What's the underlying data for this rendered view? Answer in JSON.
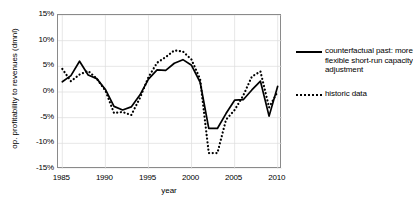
{
  "chart_data": {
    "type": "line",
    "title": "",
    "xlabel": "year",
    "ylabel": "op. profitability to revenues (dmnl)",
    "xlim": [
      1984.5,
      2010.5
    ],
    "ylim": [
      -15,
      15
    ],
    "grid": true,
    "legend_position": "right",
    "x_ticks": [
      1985,
      1990,
      1995,
      2000,
      2005,
      2010
    ],
    "x_tick_labels": [
      "1985",
      "1990",
      "1995",
      "2000",
      "2005",
      "2010"
    ],
    "y_ticks": [
      15,
      10,
      5,
      0,
      -5,
      -10,
      -15
    ],
    "y_tick_labels": [
      "15%",
      "10%",
      "5%",
      "0%",
      "-5%",
      "-10%",
      "-15%"
    ],
    "value_unit": "percent",
    "x": [
      1985,
      1986,
      1987,
      1988,
      1989,
      1990,
      1991,
      1992,
      1993,
      1994,
      1995,
      1996,
      1997,
      1998,
      1999,
      2000,
      2001,
      2002,
      2003,
      2004,
      2005,
      2006,
      2007,
      2008,
      2009,
      2010
    ],
    "series": [
      {
        "name": "counterfactual past: more flexible short-run capacity adjustment",
        "style": "solid",
        "color": "#000000",
        "values": [
          2.0,
          3.2,
          6.0,
          3.3,
          2.6,
          0.5,
          -2.8,
          -3.5,
          -2.9,
          -0.6,
          2.5,
          4.3,
          4.2,
          5.6,
          6.3,
          5.2,
          1.9,
          -7.1,
          -7.1,
          -4.2,
          -1.6,
          -1.5,
          0.4,
          2.1,
          -4.7,
          1.1
        ]
      },
      {
        "name": "historic data",
        "style": "dotted",
        "color": "#000000",
        "values": [
          4.5,
          2.1,
          3.4,
          4.1,
          2.6,
          0.3,
          -4.1,
          -3.9,
          -4.5,
          -1.2,
          2.9,
          5.7,
          6.8,
          8.1,
          7.9,
          6.3,
          2.5,
          -11.9,
          -11.9,
          -5.4,
          -3.5,
          -0.7,
          3.0,
          4.0,
          -3.0,
          0.1
        ]
      }
    ]
  },
  "legend": {
    "entries": [
      {
        "label": "counterfactual past: more flexible short-run capacity adjustment",
        "style": "solid"
      },
      {
        "label": "historic data",
        "style": "dotted"
      }
    ]
  },
  "colors": {
    "series": "#000000",
    "frame": "#8a8a8a",
    "grid": "#dcdcdc",
    "background": "#ffffff"
  }
}
